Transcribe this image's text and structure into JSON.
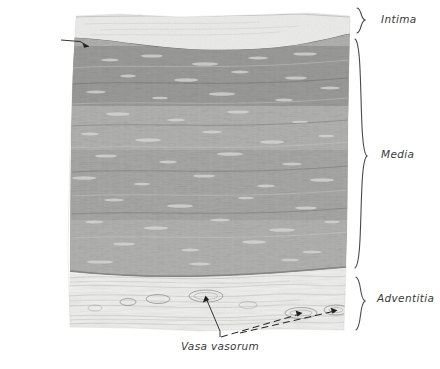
{
  "figure": {
    "type": "histology-micrograph-illustration",
    "palette": {
      "background": "#ffffff",
      "intima": "#e8e8e6",
      "media": "#7d7d7b",
      "media_dark": "#5e5e5c",
      "adventitia": "#efefee",
      "ink": "#3a3a3a",
      "leader": "#1a1a1a"
    },
    "layers": [
      {
        "id": "intima",
        "label": "Intima",
        "band_top": 14,
        "band_bottom": 46
      },
      {
        "id": "media",
        "label": "Media",
        "band_top": 46,
        "band_bottom": 272
      },
      {
        "id": "adventitia",
        "label": "Adventitia",
        "band_top": 272,
        "band_bottom": 330
      }
    ],
    "labels": {
      "intima": "Intima",
      "media": "Media",
      "adventitia": "Adventitia",
      "elastica_interna_line1": "Elastica",
      "elastica_interna_line2": "interna",
      "vasa_vasorum": "Vasa vasorum"
    },
    "braces": [
      {
        "name": "intima-brace",
        "x": 362,
        "top": 8,
        "bottom": 34
      },
      {
        "name": "media-brace",
        "x": 364,
        "top": 40,
        "bottom": 268
      },
      {
        "name": "adventitia-brace",
        "x": 362,
        "top": 276,
        "bottom": 331
      }
    ],
    "leaders": {
      "elastica_interna": {
        "from_x": 62,
        "from_y": 40,
        "to_x": 89,
        "to_y": 47
      },
      "vasa_vasorum": [
        {
          "from_x": 220,
          "from_y": 337,
          "to_x": 206,
          "to_y": 296
        },
        {
          "from_x": 222,
          "from_y": 337,
          "to_x": 301,
          "to_y": 312
        },
        {
          "from_x": 238,
          "from_y": 333,
          "to_x": 337,
          "to_y": 309
        }
      ]
    },
    "tissue_block": {
      "left_top_x": 76,
      "right_top_x": 350,
      "left_bottom_x": 66,
      "right_bottom_x": 345,
      "top_y": 14,
      "bottom_y": 330
    }
  }
}
